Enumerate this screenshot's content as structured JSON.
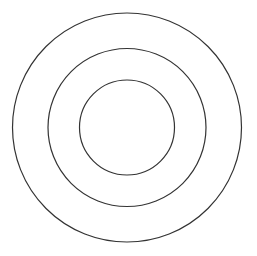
{
  "diagram": {
    "type": "concentric-circles",
    "background": "#ffffff",
    "stroke_color": "#333333",
    "stroke_width": 1.2,
    "center": {
      "x": 127,
      "y": 127.5
    },
    "circles": [
      {
        "name": "outer-circle",
        "r": 114.5
      },
      {
        "name": "middle-circle",
        "r": 79
      },
      {
        "name": "inner-circle",
        "r": 47.5
      }
    ]
  }
}
